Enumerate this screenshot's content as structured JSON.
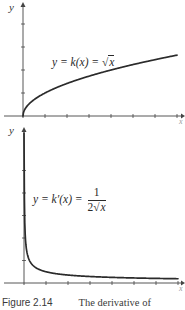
{
  "figure": {
    "caption_label": "Figure 2.14",
    "caption_text": "The derivative of"
  },
  "top_graph": {
    "y_axis_label": "y",
    "x_axis_label": "x",
    "equation_lhs": "y = k(x) = ",
    "equation_rhs_radicand": "x",
    "equation_text": "y = k(x) = √x"
  },
  "bottom_graph": {
    "y_axis_label": "y",
    "x_axis_label": "x",
    "equation_lhs": "y = k′(x) = ",
    "equation_numerator": "1",
    "equation_denominator_coef": "2",
    "equation_denominator_radicand": "x",
    "equation_text": "y = k′(x) = 1/(2√x)"
  },
  "colors": {
    "curve": "#2b2b2b",
    "axis": "#444444",
    "text": "#2a2a2a"
  },
  "chart_data": [
    {
      "type": "line",
      "title": "y = k(x) = √x",
      "xlabel": "x",
      "ylabel": "y",
      "x_ticks": [
        0,
        1,
        2,
        3,
        4,
        5,
        6,
        7
      ],
      "y_ticks": [
        0,
        1,
        2,
        3,
        4
      ],
      "xlim": [
        0,
        7
      ],
      "ylim": [
        0,
        4.5
      ],
      "grid": false,
      "series": [
        {
          "name": "k(x) = sqrt(x)",
          "function": "sqrt(x)",
          "x": [
            0,
            0.25,
            0.5,
            1,
            2,
            3,
            4,
            5,
            6,
            7
          ],
          "y": [
            0,
            0.5,
            0.71,
            1,
            1.41,
            1.73,
            2,
            2.24,
            2.45,
            2.65
          ]
        }
      ]
    },
    {
      "type": "line",
      "title": "y = k'(x) = 1/(2√x)",
      "xlabel": "x",
      "ylabel": "y",
      "x_ticks": [
        0,
        1,
        2,
        3,
        4,
        5,
        6,
        7
      ],
      "y_ticks": [
        0,
        1,
        2,
        3,
        4,
        5
      ],
      "xlim": [
        0,
        7
      ],
      "ylim": [
        0,
        6
      ],
      "grid": false,
      "series": [
        {
          "name": "k'(x) = 1/(2 sqrt(x))",
          "function": "1/(2*sqrt(x))",
          "x": [
            0.01,
            0.05,
            0.1,
            0.25,
            0.5,
            1,
            2,
            3,
            4,
            5,
            6,
            7
          ],
          "y": [
            5,
            2.24,
            1.58,
            1,
            0.71,
            0.5,
            0.35,
            0.29,
            0.25,
            0.22,
            0.2,
            0.19
          ]
        }
      ]
    }
  ]
}
